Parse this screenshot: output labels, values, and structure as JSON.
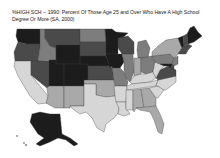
{
  "title": {
    "line1": "%HIGH SCH -- 1990: Percent Of Those Age 25 and Over Who Have A High School",
    "line2": "Degree Or More  (SA, 2000)"
  },
  "map_data": {
    "type": "choropleth",
    "variable": "Percent of those age 25 and over with high school degree or more, 1990",
    "classes": [
      {
        "level": 1,
        "label": "lowest",
        "color": "#d6d6d6"
      },
      {
        "level": 2,
        "label": "low",
        "color": "#a9a9a9"
      },
      {
        "level": 3,
        "label": "middle",
        "color": "#7d7d7d"
      },
      {
        "level": 4,
        "label": "high",
        "color": "#4a4a4a"
      },
      {
        "level": 5,
        "label": "highest",
        "color": "#1c1c1c"
      }
    ],
    "states": {
      "WA": 5,
      "OR": 4,
      "CA": 1,
      "ID": 3,
      "NV": 4,
      "MT": 4,
      "WY": 5,
      "UT": 5,
      "AZ": 2,
      "CO": 5,
      "NM": 2,
      "ND": 3,
      "SD": 4,
      "NE": 5,
      "KS": 4,
      "OK": 2,
      "TX": 1,
      "MN": 5,
      "IA": 5,
      "MO": 3,
      "AR": 1,
      "LA": 1,
      "WI": 4,
      "IL": 3,
      "MI": 3,
      "IN": 2,
      "OH": 3,
      "KY": 1,
      "TN": 1,
      "MS": 1,
      "AL": 2,
      "GA": 2,
      "FL": 2,
      "SC": 1,
      "NC": 1,
      "VA": 4,
      "WV": 1,
      "PA": 3,
      "NY": 2,
      "VT": 5,
      "NH": 4,
      "ME": 5,
      "MA": 4,
      "CT": 4,
      "NJ": 3,
      "DE": 4,
      "MD": 5,
      "AK": 5
    }
  }
}
